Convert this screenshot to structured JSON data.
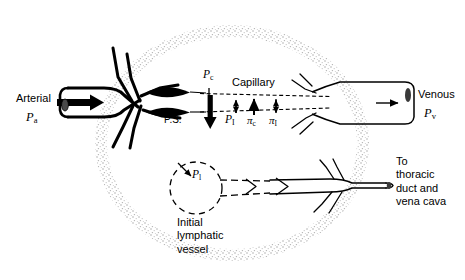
{
  "figure": {
    "background_color": "#ffffff",
    "ink_color": "#000000",
    "tissue_stipple_color": "#b9b9b9"
  },
  "labels": {
    "arterial": "Arterial",
    "arterial_pressure_symbol": "P",
    "arterial_pressure_subscript": "a",
    "venous": "Venous",
    "venous_pressure_symbol": "P",
    "venous_pressure_subscript": "v",
    "precapillary_sphincter": "P.S.",
    "capillary": "Capillary",
    "capillary_pressure_symbol": "P",
    "capillary_pressure_subscript": "c",
    "interstitial_pressure_symbol": "P",
    "interstitial_pressure_subscript": "I",
    "capillary_oncotic_symbol": "π",
    "capillary_oncotic_subscript": "c",
    "interstitial_oncotic_symbol": "π",
    "interstitial_oncotic_subscript": "I",
    "lymph_pressure_symbol": "P",
    "lymph_pressure_subscript": "l",
    "initial_lymphatic_line1": "Initial",
    "initial_lymphatic_line2": "lymphatic",
    "initial_lymphatic_line3": "vessel",
    "destination_line1": "To",
    "destination_line2": "thoracic",
    "destination_line3": "duct and",
    "destination_line4": "vena cava"
  },
  "forces": [
    {
      "name": "capillary-hydrostatic-pressure",
      "symbol": "P",
      "subscript": "c",
      "direction": "down",
      "magnitude": "large"
    },
    {
      "name": "interstitial-hydrostatic-pressure",
      "symbol": "P",
      "subscript": "I",
      "direction": "up",
      "magnitude": "small"
    },
    {
      "name": "capillary-oncotic-pressure",
      "symbol": "π",
      "subscript": "c",
      "direction": "up",
      "magnitude": "medium"
    },
    {
      "name": "interstitial-oncotic-pressure",
      "symbol": "π",
      "subscript": "I",
      "direction": "down",
      "magnitude": "small"
    }
  ],
  "flow": {
    "arterial_inflow_direction": "right",
    "venous_outflow_direction": "right",
    "lymph_outflow_direction": "right"
  }
}
